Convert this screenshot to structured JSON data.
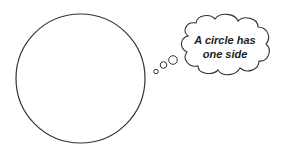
{
  "thought": {
    "line1": "A circle has",
    "line2": "one side"
  },
  "colors": {
    "stroke": "#333333",
    "background": "#ffffff"
  }
}
